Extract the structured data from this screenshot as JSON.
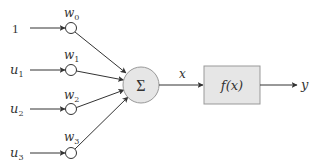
{
  "diagram": {
    "type": "artificial-neuron",
    "inputs": [
      {
        "label": "1",
        "sub": ""
      },
      {
        "label": "u",
        "sub": "1"
      },
      {
        "label": "u",
        "sub": "2"
      },
      {
        "label": "u",
        "sub": "3"
      }
    ],
    "weights": [
      {
        "label": "w",
        "sub": "0"
      },
      {
        "label": "w",
        "sub": "1"
      },
      {
        "label": "w",
        "sub": "2"
      },
      {
        "label": "w",
        "sub": "3"
      }
    ],
    "summation": {
      "symbol": "Σ"
    },
    "sum_output": {
      "label": "x"
    },
    "activation": {
      "label": "f(x)"
    },
    "output": {
      "label": "y"
    },
    "colors": {
      "line": "#333333",
      "node_fill": "#e6e6e6",
      "node_stroke": "#999999"
    }
  }
}
